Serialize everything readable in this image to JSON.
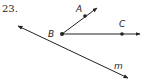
{
  "problem": {
    "number": "23."
  },
  "diagram": {
    "points": [
      {
        "name": "A",
        "label": "A",
        "x": 85,
        "y": 16
      },
      {
        "name": "B",
        "label": "B",
        "x": 62,
        "y": 34
      },
      {
        "name": "C",
        "label": "C",
        "x": 122,
        "y": 34
      }
    ],
    "rays": [
      {
        "name": "ray-BA",
        "from": "B",
        "through": "A"
      },
      {
        "name": "ray-BC",
        "from": "B",
        "through": "C"
      }
    ],
    "lines": [
      {
        "name": "line-m",
        "label": "m"
      }
    ],
    "labels": {
      "A": "A",
      "B": "B",
      "C": "C",
      "m": "m"
    },
    "stroke_color": "#222222"
  }
}
